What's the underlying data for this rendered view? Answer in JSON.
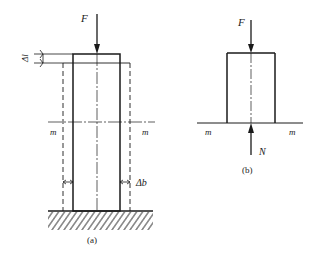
{
  "figure_a": {
    "caption": "(a)",
    "force_label": "F",
    "delta_l_label": "Δl",
    "delta_b_label": "Δb",
    "section_left_label": "m",
    "section_right_label": "m"
  },
  "figure_b": {
    "caption": "(b)",
    "force_label": "F",
    "reaction_label": "N",
    "section_left_label": "m",
    "section_right_label": "m"
  },
  "colors": {
    "line": "#1a1a1a",
    "background": "#ffffff"
  }
}
